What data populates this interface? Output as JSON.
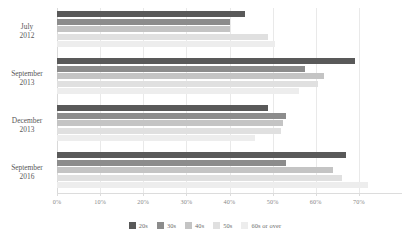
{
  "chart_data": {
    "type": "bar",
    "orientation": "horizontal",
    "title": "",
    "subtitle": "",
    "xlabel": "",
    "ylabel": "",
    "xlim": [
      0,
      80
    ],
    "xticks": [
      0,
      10,
      20,
      30,
      40,
      50,
      60,
      70
    ],
    "xtick_labels": [
      "0%",
      "10%",
      "20%",
      "30%",
      "40%",
      "50%",
      "60%",
      "70%"
    ],
    "grid": true,
    "legend_position": "bottom",
    "categories": [
      "July\n2012",
      "September\n2013",
      "December\n2013",
      "September\n2016"
    ],
    "category_lines": [
      [
        "July",
        "2012"
      ],
      [
        "September",
        "2013"
      ],
      [
        "December",
        "2013"
      ],
      [
        "September",
        "2016"
      ]
    ],
    "series": [
      {
        "name": "20s",
        "color": "#595959",
        "values": [
          43.5,
          69.0,
          49.0,
          67.0
        ]
      },
      {
        "name": "30s",
        "color": "#8c8c8c",
        "values": [
          40.0,
          57.5,
          53.0,
          53.0
        ]
      },
      {
        "name": "40s",
        "color": "#c4c4c4",
        "values": [
          40.0,
          62.0,
          52.5,
          64.0
        ]
      },
      {
        "name": "50s",
        "color": "#e0e0e0",
        "values": [
          49.0,
          60.5,
          52.0,
          66.0
        ]
      },
      {
        "name": "60s or over",
        "color": "#ededed",
        "values": [
          50.5,
          56.0,
          46.0,
          72.0
        ]
      }
    ]
  },
  "legend": {
    "items": [
      {
        "label": "20s",
        "color": "#595959"
      },
      {
        "label": "30s",
        "color": "#8c8c8c"
      },
      {
        "label": "40s",
        "color": "#c4c4c4"
      },
      {
        "label": "50s",
        "color": "#e0e0e0"
      },
      {
        "label": "60s or over",
        "color": "#ededed"
      }
    ]
  }
}
